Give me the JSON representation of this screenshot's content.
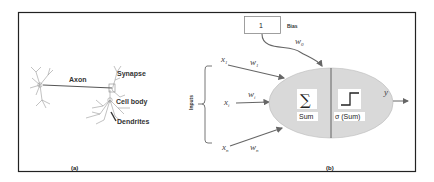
{
  "panel_a": {
    "caption": "(a)",
    "labels": {
      "axon": "Axon",
      "synapse": "Synapse",
      "cell_body": "Cell body",
      "dendrites": "Dendrites"
    }
  },
  "panel_b": {
    "caption": "(b)",
    "bias_value": "1",
    "bias_label": "Bias",
    "bias_weight": "w",
    "bias_weight_sub": "0",
    "inputs_label": "Inputs",
    "inputs": [
      {
        "x": "x",
        "x_sub": "1",
        "w": "w",
        "w_sub": "1"
      },
      {
        "x": "x",
        "x_sub": "i",
        "w": "w",
        "w_sub": "i"
      },
      {
        "x": "x",
        "x_sub": "n",
        "w": "w",
        "w_sub": "n"
      }
    ],
    "sum_symbol": "∑",
    "sum_label": "Sum",
    "activation_label": "σ (Sum)",
    "output": "y",
    "colors": {
      "node_fill": "#d9d9d9",
      "border": "#222222",
      "arrow": "#666666"
    }
  }
}
